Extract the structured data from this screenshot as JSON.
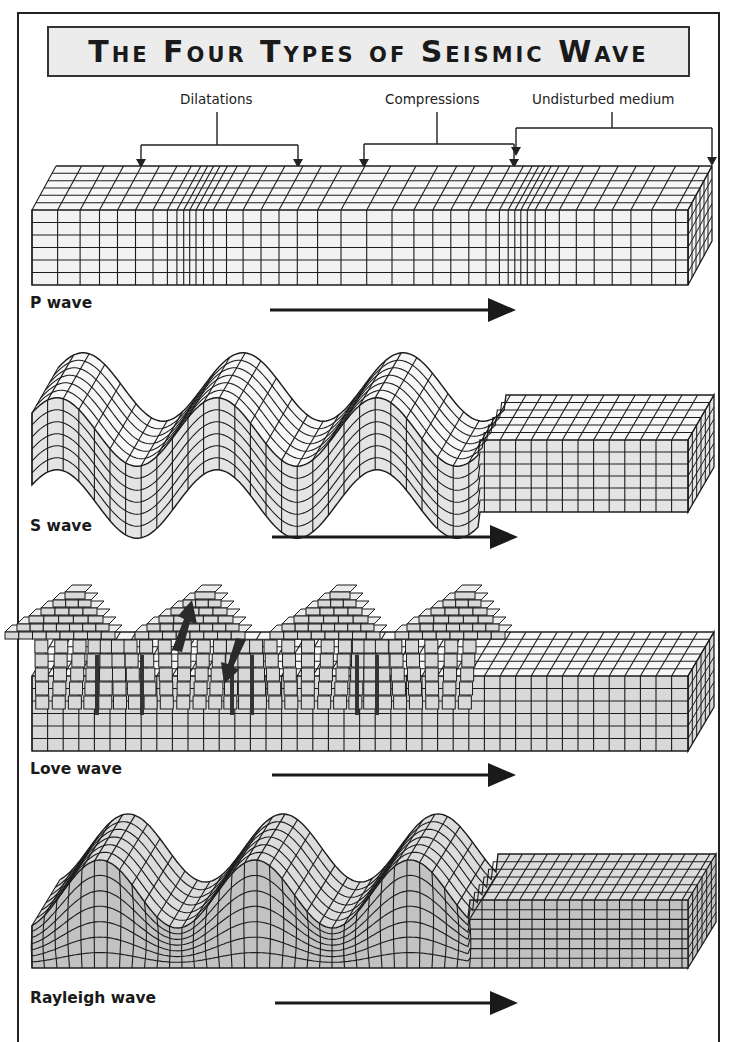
{
  "title": "The Four Types of Seismic Wave",
  "callouts": {
    "dilatations": "Dilatations",
    "compressions": "Compressions",
    "undisturbed": "Undisturbed medium"
  },
  "waves": [
    {
      "id": "p",
      "label": "P wave",
      "fill": "#f2f2f2",
      "direction_icon": "arrow-right-icon"
    },
    {
      "id": "s",
      "label": "S wave",
      "fill": "#e4e4e4",
      "direction_icon": "arrow-right-icon"
    },
    {
      "id": "love",
      "label": "Love wave",
      "fill": "#d8d8d8",
      "direction_icon": "arrow-right-icon",
      "motion_icons": [
        "arrow-up-right-icon",
        "arrow-down-left-icon"
      ]
    },
    {
      "id": "rayleigh",
      "label": "Rayleigh wave",
      "fill": "#c2c2c2",
      "direction_icon": "arrow-right-icon"
    }
  ],
  "colors": {
    "line": "#1c1c1c",
    "title_bg": "#ececec",
    "frame": "#222222"
  }
}
